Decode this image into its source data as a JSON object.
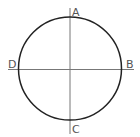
{
  "diagram": {
    "type": "circle-with-axes",
    "labels": {
      "top": "A",
      "right": "B",
      "bottom": "C",
      "left": "D"
    },
    "colors": {
      "circle": "#222222",
      "axes": "#777777",
      "labels": "#555555"
    }
  }
}
